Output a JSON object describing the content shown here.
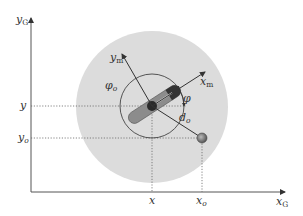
{
  "diagram": {
    "type": "robot-object geometry",
    "axes": {
      "global_x": {
        "symbol": "x",
        "sub": "G"
      },
      "global_y": {
        "symbol": "y",
        "sub": "G"
      },
      "robot_x": {
        "symbol": "x",
        "sub": "m"
      },
      "robot_y": {
        "symbol": "y",
        "sub": "m"
      }
    },
    "labels": {
      "x": "x",
      "y": "y",
      "x_o": {
        "symbol": "x",
        "sub": "o"
      },
      "y_o": {
        "symbol": "y",
        "sub": "o"
      },
      "phi": "φ",
      "phi_o": {
        "symbol": "φ",
        "sub": "o"
      },
      "d_o": {
        "symbol": "d",
        "sub": "o"
      }
    },
    "colors": {
      "sensing_region": "#dcdcdc",
      "robot_body": "#8c8c8c",
      "robot_center": "#2a2a2a",
      "object": "#777777",
      "lines": "#444444"
    }
  }
}
